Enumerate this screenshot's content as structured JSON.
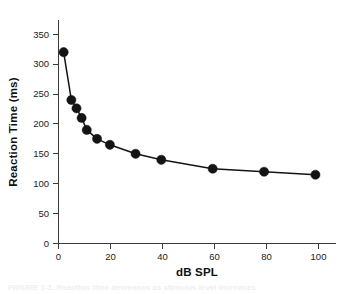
{
  "figure": {
    "background_color": "#ffffff",
    "caption_fragment": "FIGURE 1-1.  Reaction time decreases as stimulus level increases"
  },
  "chart_data": {
    "type": "line",
    "title": "",
    "subtitle": "",
    "xlabel": "dB SPL",
    "ylabel": "Reaction Time (ms)",
    "x": [
      2,
      5,
      7,
      9,
      11,
      15,
      20,
      30,
      40,
      60,
      80,
      100
    ],
    "values": [
      320,
      240,
      226,
      210,
      190,
      175,
      165,
      150,
      140,
      125,
      120,
      115
    ],
    "series": [
      {
        "name": "Reaction Time",
        "x": [
          2,
          5,
          7,
          9,
          11,
          15,
          20,
          30,
          40,
          60,
          80,
          100
        ],
        "values": [
          320,
          240,
          226,
          210,
          190,
          175,
          165,
          150,
          140,
          125,
          120,
          115
        ],
        "color": "#141414",
        "marker": "filled-circle",
        "marker_size": 6
      }
    ],
    "xlim": [
      0,
      108
    ],
    "ylim": [
      0,
      350
    ],
    "xticks": [
      0,
      20,
      40,
      60,
      80,
      100
    ],
    "yticks": [
      0,
      50,
      100,
      150,
      200,
      250,
      300,
      350
    ],
    "xtick_labels": [
      "0",
      "20",
      "40",
      "60",
      "80",
      "100"
    ],
    "ytick_labels": [
      "0",
      "50",
      "100",
      "150",
      "200",
      "250",
      "300",
      "350"
    ],
    "grid": false,
    "legend": false,
    "legend_position": "none",
    "annotations": [],
    "line_color": "#141414",
    "axis_color": "#3a3a3a"
  }
}
